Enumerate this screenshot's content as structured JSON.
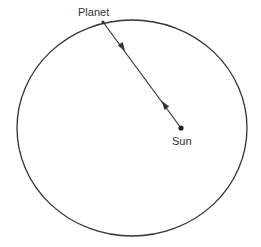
{
  "diagram": {
    "labels": {
      "planet": "Planet",
      "sun": "Sun"
    },
    "colors": {
      "stroke": "#333333",
      "background": "#ffffff"
    },
    "orbit": {
      "cx": 132,
      "cy": 128,
      "rx": 115,
      "ry": 108
    },
    "planet_position": {
      "x": 103,
      "y": 22
    },
    "sun_position": {
      "x": 181,
      "y": 128
    },
    "arrows": [
      {
        "direction": "toward-sun",
        "x": 122,
        "y": 47
      },
      {
        "direction": "toward-planet",
        "x": 165,
        "y": 105
      }
    ]
  }
}
